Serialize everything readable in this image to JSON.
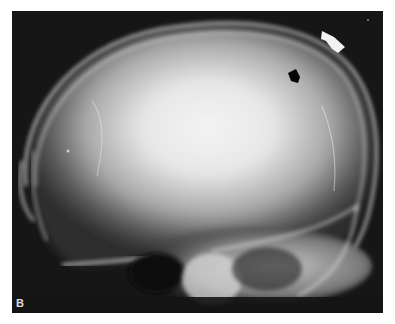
{
  "figure": {
    "panel_label": "B",
    "annotations": [
      {
        "type": "arrow",
        "color": "white",
        "position": "upper right, outside calvarium"
      },
      {
        "type": "arrow",
        "color": "black",
        "position": "upper right, inner table"
      }
    ]
  }
}
